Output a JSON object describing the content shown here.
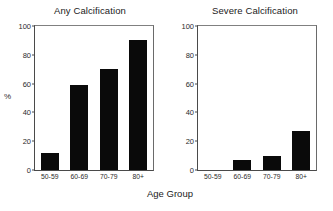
{
  "figure": {
    "xaxis_title": "Age Group",
    "ylabel": "%"
  },
  "chart_data": [
    {
      "type": "bar",
      "title": "Any Calcification",
      "categories": [
        "50-59",
        "60-69",
        "70-79",
        "80+"
      ],
      "values": [
        12,
        59,
        70,
        90
      ],
      "xlabel": "Age Group",
      "ylabel": "%",
      "ylim": [
        0,
        100
      ],
      "yticks": [
        0,
        20,
        40,
        60,
        80,
        100
      ],
      "grid": false,
      "legend": "none",
      "bar_color": "#0a0a0a"
    },
    {
      "type": "bar",
      "title": "Severe Calcification",
      "categories": [
        "50-59",
        "60-69",
        "70-79",
        "80+"
      ],
      "values": [
        0,
        7,
        10,
        27
      ],
      "xlabel": "Age Group",
      "ylabel": "%",
      "ylim": [
        0,
        100
      ],
      "yticks": [
        0,
        20,
        40,
        60,
        80,
        100
      ],
      "grid": false,
      "legend": "none",
      "bar_color": "#0a0a0a"
    }
  ],
  "ytick_labels": [
    "100",
    "80",
    "60",
    "40",
    "20",
    "0"
  ]
}
